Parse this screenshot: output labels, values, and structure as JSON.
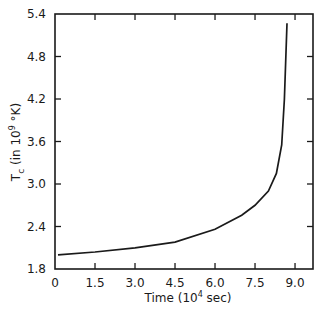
{
  "chart_data": {
    "type": "line",
    "title": "",
    "xlabel": "Time (10^4 sec)",
    "xlabel_parts": {
      "main": "Time (10",
      "sup": "4",
      "tail": " sec)"
    },
    "ylabel": "T_c (in 10^9 °K)",
    "ylabel_parts": {
      "main": "T",
      "sub": "c",
      "mid": " (in 10",
      "sup": "9",
      "tail": " °K)"
    },
    "xlim": [
      0,
      9.6
    ],
    "ylim": [
      1.8,
      5.4
    ],
    "xticks": [
      "0",
      "1.5",
      "3.0",
      "4.5",
      "6.0",
      "7.5",
      "9.0"
    ],
    "xtick_values": [
      0,
      1.5,
      3.0,
      4.5,
      6.0,
      7.5,
      9.0
    ],
    "yticks": [
      "1.8",
      "2.4",
      "3.0",
      "3.6",
      "4.2",
      "4.8",
      "5.4"
    ],
    "ytick_values": [
      1.8,
      2.4,
      3.0,
      3.6,
      4.2,
      4.8,
      5.4
    ],
    "grid": false,
    "legend": null,
    "series": [
      {
        "name": "T_c",
        "x": [
          0,
          1.5,
          3.0,
          4.5,
          6.0,
          7.0,
          7.5,
          8.0,
          8.3,
          8.5,
          8.6,
          8.7
        ],
        "y": [
          2.0,
          2.04,
          2.1,
          2.18,
          2.36,
          2.56,
          2.7,
          2.9,
          3.15,
          3.55,
          4.2,
          5.27
        ]
      }
    ]
  }
}
